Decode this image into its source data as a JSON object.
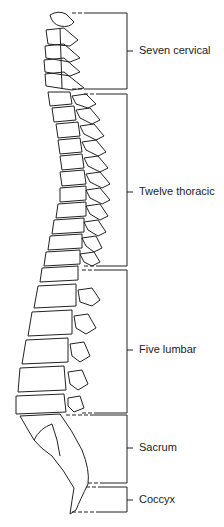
{
  "diagram": {
    "regions": [
      {
        "label": "Seven cervical",
        "top": 13,
        "bottom": 89,
        "label_y": 51
      },
      {
        "label": "Twelve thoracic",
        "top": 94,
        "bottom": 266,
        "label_y": 192
      },
      {
        "label": "Five lumbar",
        "top": 270,
        "bottom": 413,
        "label_y": 350
      },
      {
        "label": "Sacrum",
        "top": 415,
        "bottom": 483,
        "label_y": 448
      },
      {
        "label": "Coccyx",
        "top": 487,
        "bottom": 512,
        "label_y": 500
      }
    ],
    "colors": {
      "line": "#222222",
      "background": "#ffffff"
    }
  }
}
